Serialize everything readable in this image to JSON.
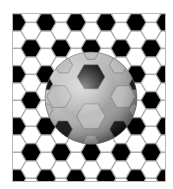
{
  "illustration": {
    "subject": "soccer-ball-on-hexagon-pattern",
    "colors": {
      "background": "#ffffff",
      "frame": "#b8b8b8",
      "hex_black": "#000000",
      "hex_white": "#ffffff",
      "hex_outline": "#9a9a9a",
      "ball_light": "#e6e6e6",
      "ball_mid": "#a8a8a8",
      "ball_dark": "#5e5e5e"
    },
    "frame": {
      "x": 12,
      "y": 13,
      "width": 154,
      "height": 169
    },
    "ball": {
      "cx": 91,
      "cy": 98,
      "r": 46
    },
    "hex_radius": 10
  }
}
